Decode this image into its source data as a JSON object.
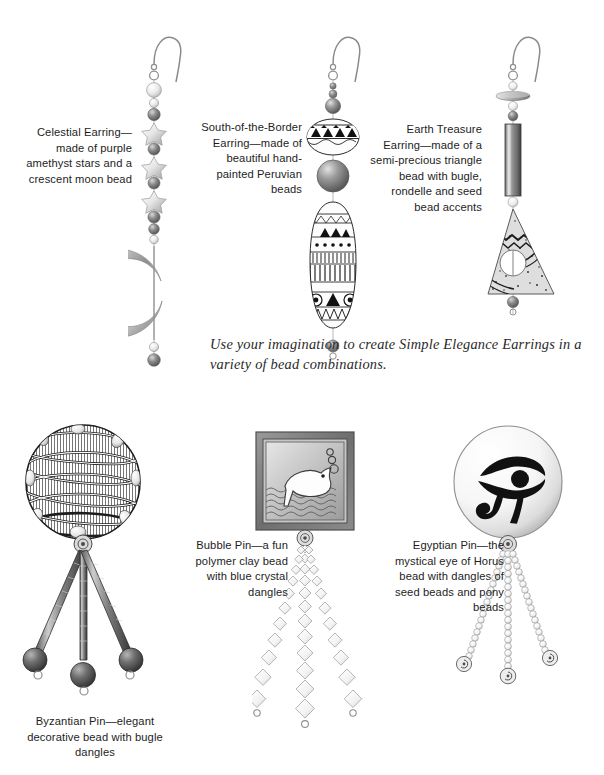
{
  "page": {
    "background_color": "#ffffff",
    "width": 604,
    "height": 775
  },
  "tagline": {
    "text": "Use your imagination to create Simple Elegance Earrings in a variety of bead combinations.",
    "style": "italic-serif"
  },
  "items": [
    {
      "id": "celestial-earring",
      "caption": "Celestial Earring—made of purple amethyst stars and a crescent moon bead",
      "caption_align": "right",
      "name": "Celestial Earring",
      "components": [
        "ear wire",
        "seed beads",
        "amethyst stars",
        "crescent moon bead"
      ]
    },
    {
      "id": "south-of-the-border-earring",
      "caption": "South-of-the-Border Earring—made of beautiful hand-painted Peruvian beads",
      "caption_align": "right",
      "name": "South-of-the-Border Earring",
      "components": [
        "ear wire",
        "seed beads",
        "painted disc bead",
        "round bead",
        "painted teardrop bead"
      ]
    },
    {
      "id": "earth-treasure-earring",
      "caption": "Earth Treasure Earring—made of a semi-precious triangle bead with bugle, rondelle and seed bead accents",
      "caption_align": "right",
      "name": "Earth Treasure Earring",
      "components": [
        "ear wire",
        "rondelle",
        "seed beads",
        "bugle bead",
        "triangle bead"
      ]
    },
    {
      "id": "byzantian-pin",
      "caption": "Byzantian Pin—elegant decorative bead with bugle dangles",
      "caption_align": "center",
      "name": "Byzantian Pin",
      "components": [
        "decorative round bead",
        "bead cap",
        "bugle dangles",
        "round end beads"
      ]
    },
    {
      "id": "bubble-pin",
      "caption": "Bubble Pin—a fun polymer clay bead with blue crystal dangles",
      "caption_align": "right",
      "name": "Bubble Pin",
      "components": [
        "square polymer clay fish bead",
        "bead cap",
        "crystal bicone dangles"
      ]
    },
    {
      "id": "egyptian-pin",
      "caption": "Egyptian Pin—the mystical eye of Horus bead with dangles of seed beads and pony beads",
      "caption_align": "right",
      "name": "Egyptian Pin",
      "components": [
        "eye of Horus round bead",
        "bead cap",
        "seed bead dangles",
        "pony beads"
      ]
    }
  ],
  "colors": {
    "ink": "#1d1d1d",
    "metal_light": "#f2f2f2",
    "metal_mid": "#9a9a9a",
    "metal_dark": "#4a4a4a",
    "bead_dark": "#6d6d6d",
    "bead_light": "#e8e8e8",
    "frame": "#7d7d7d",
    "water": "#b9b9b9"
  }
}
